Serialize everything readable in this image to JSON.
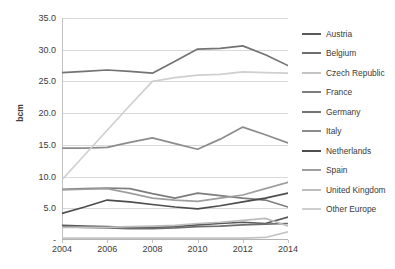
{
  "chart_data": {
    "type": "line",
    "title": "",
    "xlabel": "",
    "ylabel": "bcm",
    "x": [
      2004,
      2005,
      2006,
      2007,
      2008,
      2009,
      2010,
      2011,
      2012,
      2013,
      2014
    ],
    "xticks": [
      "2004",
      "2006",
      "2008",
      "2010",
      "2012",
      "2014"
    ],
    "yticks": [
      "35.0",
      "30.0",
      "25.0",
      "20.0",
      "15.0",
      "10.0",
      "5.0",
      "-"
    ],
    "ylim": [
      0,
      35
    ],
    "xlim": [
      2004,
      2014
    ],
    "grid": true,
    "legend_position": "right",
    "series": [
      {
        "name": "Austria",
        "color": "#595959",
        "values": [
          2.3,
          2.2,
          2.1,
          2.0,
          2.0,
          2.1,
          2.4,
          2.6,
          2.8,
          2.6,
          3.6
        ]
      },
      {
        "name": "Belgium",
        "color": "#6e6e6e",
        "values": [
          2.1,
          2.0,
          1.9,
          1.8,
          1.8,
          1.9,
          2.1,
          2.2,
          2.4,
          2.5,
          2.6
        ]
      },
      {
        "name": "Czech Republic",
        "color": "#c4c4c4",
        "values": [
          0.3,
          0.3,
          0.3,
          0.3,
          0.3,
          0.3,
          0.3,
          0.3,
          0.3,
          0.4,
          1.3
        ]
      },
      {
        "name": "France",
        "color": "#7d7d7d",
        "values": [
          8.0,
          8.1,
          8.2,
          8.1,
          7.3,
          6.6,
          7.4,
          7.0,
          6.6,
          6.3,
          5.2
        ]
      },
      {
        "name": "Germany",
        "color": "#737373",
        "values": [
          26.4,
          26.6,
          26.8,
          26.6,
          26.3,
          28.2,
          30.1,
          30.2,
          30.6,
          29.2,
          27.5
        ]
      },
      {
        "name": "Italy",
        "color": "#8c8c8c",
        "values": [
          14.5,
          14.5,
          14.6,
          15.4,
          16.1,
          15.2,
          14.3,
          15.9,
          17.8,
          16.6,
          15.3
        ]
      },
      {
        "name": "Netherlands",
        "color": "#4d4d4d",
        "values": [
          4.2,
          5.2,
          6.3,
          6.0,
          5.6,
          5.2,
          4.9,
          5.4,
          6.0,
          6.6,
          7.4
        ]
      },
      {
        "name": "Spain",
        "color": "#9e9e9e",
        "values": [
          7.9,
          8.0,
          8.1,
          7.4,
          6.6,
          6.3,
          6.1,
          6.6,
          7.1,
          8.1,
          9.1
        ]
      },
      {
        "name": "United Kingdom",
        "color": "#bdbdbd",
        "values": [
          2.0,
          2.0,
          2.0,
          2.1,
          2.2,
          2.3,
          2.6,
          2.8,
          3.1,
          3.4,
          2.2
        ]
      },
      {
        "name": "Other Europe",
        "color": "#cfcfcf",
        "values": [
          9.5,
          13.4,
          17.3,
          21.2,
          25.0,
          25.6,
          26.0,
          26.1,
          26.5,
          26.4,
          26.3
        ]
      }
    ]
  }
}
